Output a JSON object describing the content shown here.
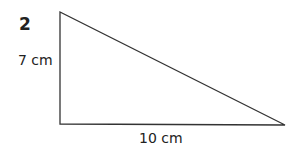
{
  "question_number": "2",
  "triangle": {
    "vertices": [
      [
        60,
        12
      ],
      [
        60,
        124
      ],
      [
        285,
        125
      ]
    ],
    "stroke": "#333333",
    "height_label": "7 cm",
    "base_label": "10 cm",
    "right_angle_at": "bottom-left"
  }
}
